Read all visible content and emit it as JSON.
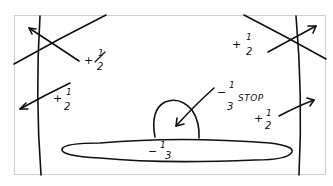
{
  "diagram": {
    "type": "hand-drawn exposure adjustment sketch",
    "frame": {
      "border_color": "#cfcfcf",
      "ink_color": "#111111"
    },
    "labels": [
      {
        "id": "top-left",
        "sign": "+",
        "numerator": "1",
        "denominator": "2",
        "arrow": "points to upper-left corner"
      },
      {
        "id": "mid-left",
        "sign": "+",
        "numerator": "1",
        "denominator": "2",
        "arrow": "points to left edge"
      },
      {
        "id": "top-right",
        "sign": "+",
        "numerator": "1",
        "denominator": "2",
        "arrow": "points to upper-right corner"
      },
      {
        "id": "mid-right",
        "sign": "+",
        "numerator": "1",
        "denominator": "2",
        "arrow": "points to right edge"
      },
      {
        "id": "dome",
        "sign": "−",
        "numerator": "1",
        "denominator": "3",
        "suffix": "STOP",
        "arrow": "points into dome shape"
      },
      {
        "id": "ellipse",
        "sign": "−",
        "numerator": "1",
        "denominator": "3"
      }
    ],
    "shapes": [
      "left curved vertical line",
      "right curved vertical line",
      "top-left diagonal line",
      "top-right diagonal line",
      "dome (half-oval) on ellipse",
      "long horizontal ellipse"
    ]
  }
}
